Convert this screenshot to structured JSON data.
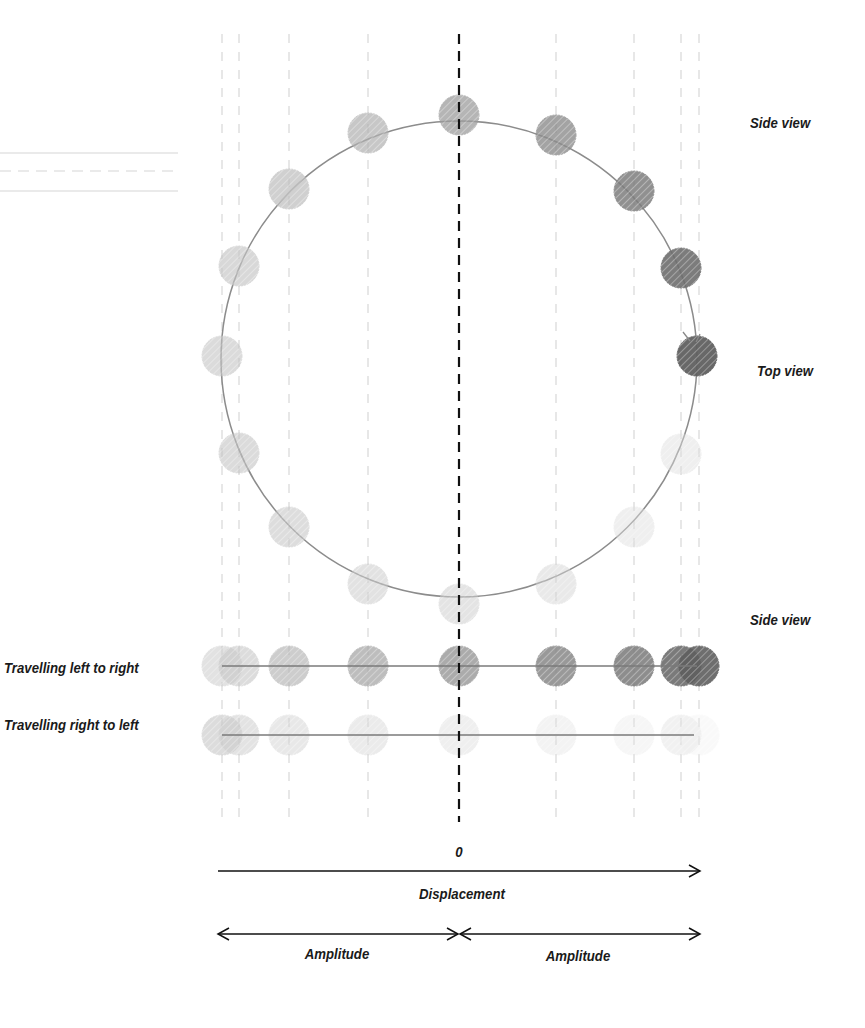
{
  "diagram": {
    "labels": {
      "side_view_top": "Side view",
      "top_view": "Top view",
      "side_view_bottom": "Side view",
      "row_left_to_right": "Travelling left to right",
      "row_right_to_left": "Travelling right to left",
      "zero": "0",
      "displacement": "Displacement",
      "amplitude_left": "Amplitude",
      "amplitude_right": "Amplitude"
    },
    "circle": {
      "cx": 459,
      "cy": 359,
      "r": 238,
      "stroke": "#8c8c8c"
    },
    "center_line": {
      "x": 459,
      "y1": 34,
      "y2": 822,
      "color": "#111111"
    },
    "guide_lines_x": [
      222,
      239,
      289,
      368,
      459,
      556,
      634,
      681,
      699
    ],
    "guide_color": "#cfcfcf",
    "dot_radius": 20,
    "circle_dots": [
      {
        "angle_deg": 90,
        "x": 459,
        "y": 115,
        "shade": "#9d9d9d",
        "opacity": 0.75
      },
      {
        "angle_deg": 60,
        "x": 556,
        "y": 135,
        "shade": "#8d8d8d",
        "opacity": 0.8
      },
      {
        "angle_deg": 30,
        "x": 634,
        "y": 191,
        "shade": "#7d7d7d",
        "opacity": 0.85
      },
      {
        "angle_deg": 10,
        "x": 681,
        "y": 268,
        "shade": "#6e6e6e",
        "opacity": 0.9
      },
      {
        "angle_deg": 0,
        "x": 697,
        "y": 356,
        "shade": "#606060",
        "opacity": 0.95
      },
      {
        "angle_deg": -20,
        "x": 681,
        "y": 454,
        "shade": "#dcdcdc",
        "opacity": 0.45
      },
      {
        "angle_deg": -45,
        "x": 634,
        "y": 527,
        "shade": "#dcdcdc",
        "opacity": 0.45
      },
      {
        "angle_deg": -65,
        "x": 556,
        "y": 584,
        "shade": "#d5d5d5",
        "opacity": 0.5
      },
      {
        "angle_deg": -90,
        "x": 459,
        "y": 604,
        "shade": "#cfcfcf",
        "opacity": 0.55
      },
      {
        "angle_deg": -115,
        "x": 368,
        "y": 584,
        "shade": "#cccccc",
        "opacity": 0.55
      },
      {
        "angle_deg": -140,
        "x": 289,
        "y": 527,
        "shade": "#c8c8c8",
        "opacity": 0.6
      },
      {
        "angle_deg": -160,
        "x": 239,
        "y": 453,
        "shade": "#c4c4c4",
        "opacity": 0.6
      },
      {
        "angle_deg": 180,
        "x": 222,
        "y": 356,
        "shade": "#c4c4c4",
        "opacity": 0.6
      },
      {
        "angle_deg": 160,
        "x": 239,
        "y": 266,
        "shade": "#c4c4c4",
        "opacity": 0.65
      },
      {
        "angle_deg": 140,
        "x": 289,
        "y": 189,
        "shade": "#bdbdbd",
        "opacity": 0.7
      },
      {
        "angle_deg": 115,
        "x": 368,
        "y": 133,
        "shade": "#b0b0b0",
        "opacity": 0.7
      }
    ],
    "row_left_to_right": {
      "y": 666,
      "line_x1": 222,
      "line_x2": 697,
      "dots": [
        {
          "x": 222,
          "shade": "#cfcfcf",
          "opacity": 0.6
        },
        {
          "x": 239,
          "shade": "#c6c6c6",
          "opacity": 0.6
        },
        {
          "x": 289,
          "shade": "#b8b8b8",
          "opacity": 0.7
        },
        {
          "x": 368,
          "shade": "#a8a8a8",
          "opacity": 0.75
        },
        {
          "x": 459,
          "shade": "#979797",
          "opacity": 0.8
        },
        {
          "x": 556,
          "shade": "#888888",
          "opacity": 0.85
        },
        {
          "x": 634,
          "shade": "#7a7a7a",
          "opacity": 0.85
        },
        {
          "x": 681,
          "shade": "#6c6c6c",
          "opacity": 0.9
        },
        {
          "x": 699,
          "shade": "#5f5f5f",
          "opacity": 0.9
        }
      ]
    },
    "row_right_to_left": {
      "y": 735,
      "line_x1": 222,
      "line_x2": 694,
      "dots": [
        {
          "x": 222,
          "shade": "#c6c6c6",
          "opacity": 0.6
        },
        {
          "x": 239,
          "shade": "#cdcdcd",
          "opacity": 0.55
        },
        {
          "x": 289,
          "shade": "#d3d3d3",
          "opacity": 0.5
        },
        {
          "x": 368,
          "shade": "#d8d8d8",
          "opacity": 0.5
        },
        {
          "x": 459,
          "shade": "#dcdcdc",
          "opacity": 0.45
        },
        {
          "x": 556,
          "shade": "#e2e2e2",
          "opacity": 0.4
        },
        {
          "x": 634,
          "shade": "#e6e6e6",
          "opacity": 0.35
        },
        {
          "x": 681,
          "shade": "#e2e2e2",
          "opacity": 0.45
        },
        {
          "x": 699,
          "shade": "#eeeeee",
          "opacity": 0.3
        }
      ]
    },
    "displacement_axis": {
      "x1": 218,
      "x2": 700,
      "y": 871
    },
    "amplitude_axis": {
      "x1": 218,
      "xmid": 459,
      "x2": 700,
      "y": 934
    },
    "faded_lines_top_left": [
      {
        "y": 153,
        "style": "solid"
      },
      {
        "y": 171,
        "style": "dashed"
      },
      {
        "y": 191,
        "style": "solid"
      }
    ]
  }
}
